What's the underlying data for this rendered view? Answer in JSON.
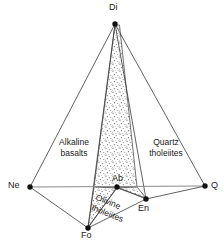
{
  "figure": {
    "colors": {
      "line": "#3b3b3b",
      "base_line": "#8a8a8a",
      "vertex": "#111111",
      "stipple": "#6e6e6e",
      "background": "#ffffff",
      "text": "#1a1a1a"
    }
  },
  "vertices": [
    {
      "id": "di",
      "label": "Di",
      "x": 115,
      "y": 24,
      "label_x": 109,
      "label_y": 3
    },
    {
      "id": "ne",
      "label": "Ne",
      "x": 30,
      "y": 187,
      "label_x": 8,
      "label_y": 181
    },
    {
      "id": "q",
      "label": "Q",
      "x": 205,
      "y": 186,
      "label_x": 211,
      "label_y": 181
    },
    {
      "id": "fo",
      "label": "Fo",
      "x": 88,
      "y": 228,
      "label_x": 81,
      "label_y": 231
    },
    {
      "id": "en",
      "label": "En",
      "x": 146,
      "y": 199,
      "label_x": 139,
      "label_y": 204
    },
    {
      "id": "ab",
      "label": "Ab",
      "x": 117,
      "y": 187,
      "label_x": 113,
      "label_y": 174
    }
  ],
  "edges": [
    {
      "id": "di-ne",
      "from": "di",
      "to": "ne",
      "kind": "solid"
    },
    {
      "id": "di-q",
      "from": "di",
      "to": "q",
      "kind": "solid"
    },
    {
      "id": "di-fo",
      "from": "di",
      "to": "fo",
      "kind": "solid"
    },
    {
      "id": "di-en",
      "from": "di",
      "to": "en",
      "kind": "solid"
    },
    {
      "id": "ne-q",
      "from": "ne",
      "to": "q",
      "kind": "base"
    },
    {
      "id": "ne-fo",
      "from": "ne",
      "to": "fo",
      "kind": "solid"
    },
    {
      "id": "fo-en",
      "from": "fo",
      "to": "en",
      "kind": "solid"
    },
    {
      "id": "en-q",
      "from": "en",
      "to": "q",
      "kind": "solid"
    },
    {
      "id": "ab-fo",
      "from": "ab",
      "to": "fo",
      "kind": "solid"
    },
    {
      "id": "ab-en",
      "from": "ab",
      "to": "en",
      "kind": "solid"
    }
  ],
  "fields": [
    {
      "id": "alkaline-basalts",
      "line1": "Alkaline",
      "line2": "basalts",
      "x": 52,
      "y": 139,
      "w": 46,
      "rotate": 0
    },
    {
      "id": "quartz-tholeiites",
      "line1": "Quartz",
      "line2": "tholeiites",
      "x": 142,
      "y": 139,
      "w": 48,
      "rotate": 0
    },
    {
      "id": "olivine-tholeiites",
      "line1": "Olivine",
      "line2": "tholeiites",
      "x": 100,
      "y": 194,
      "w": 46,
      "rotate": 22
    }
  ],
  "regions": [
    {
      "id": "critical-plane-upper",
      "name": "stippled-plane-di-ab",
      "points": "115,25 119.5,25 137,187 94,187"
    },
    {
      "id": "critical-plane-fo-lobe",
      "name": "stippled-plane-ab-fo",
      "points": "94,187 117,188 88,227"
    },
    {
      "id": "critical-plane-en-lobe",
      "name": "stippled-plane-ab-en",
      "points": "117,188 137,187 146,198"
    }
  ]
}
